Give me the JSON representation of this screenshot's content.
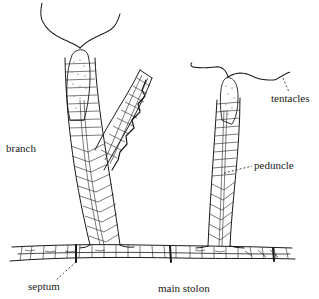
{
  "figure": {
    "labels": {
      "tentacles": "tentacles",
      "branch": "branch",
      "peduncle": "peduncle",
      "septum": "septum",
      "main_stolon": "main stolon"
    }
  },
  "colors": {
    "ink": "#1a1a1a",
    "background": "#ffffff"
  }
}
